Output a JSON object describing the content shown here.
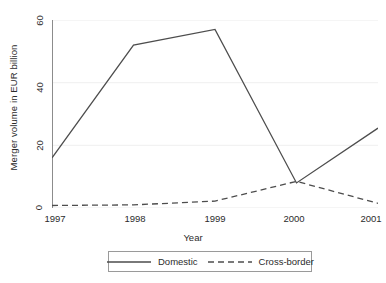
{
  "chart_data": {
    "type": "line",
    "title": "",
    "xlabel": "Year",
    "ylabel": "Merger volume in EUR billion",
    "x": [
      1997,
      1998,
      1999,
      2000,
      2001
    ],
    "categories": [
      "1997",
      "1998",
      "1999",
      "2000",
      "2001"
    ],
    "xtick_labels": [
      "1997",
      "1998",
      "1999",
      "2000",
      "2001"
    ],
    "ytick_labels": [
      "0",
      "20",
      "40",
      "60"
    ],
    "yticks": [
      0,
      20,
      40,
      60
    ],
    "ylim": [
      0,
      60
    ],
    "xlim": [
      1997,
      2001
    ],
    "grid": "horizontal-faint",
    "legend_position": "below-axis-centered",
    "series": [
      {
        "name": "Domestic",
        "style": "solid",
        "color": "#4d4d4d",
        "values": [
          16,
          52,
          57,
          8,
          25.5
        ]
      },
      {
        "name": "Cross-border",
        "style": "dashed",
        "color": "#4d4d4d",
        "values": [
          0.8,
          1.0,
          2.2,
          8.5,
          1.5
        ]
      }
    ]
  },
  "legend": {
    "items": [
      {
        "label": "Domestic",
        "style": "solid"
      },
      {
        "label": "Cross-border",
        "style": "dashed"
      }
    ]
  },
  "colors": {
    "line": "#4d4d4d",
    "axis": "#8c8c8c",
    "grid": "#f2f2f2",
    "text": "#2b2b2b",
    "background": "#ffffff"
  }
}
